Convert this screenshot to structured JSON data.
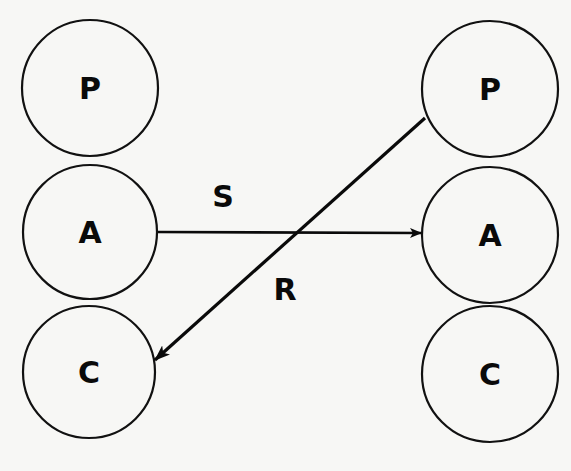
{
  "diagram": {
    "left_column": {
      "nodes": [
        {
          "id": "left-P",
          "label": "P",
          "cx": 90,
          "cy": 88,
          "r": 68
        },
        {
          "id": "left-A",
          "label": "A",
          "cx": 90,
          "cy": 232,
          "r": 67
        },
        {
          "id": "left-C",
          "label": "C",
          "cx": 89,
          "cy": 372,
          "r": 66
        }
      ]
    },
    "right_column": {
      "nodes": [
        {
          "id": "right-P",
          "label": "P",
          "cx": 490,
          "cy": 89,
          "r": 68
        },
        {
          "id": "right-A",
          "label": "A",
          "cx": 490,
          "cy": 235,
          "r": 68
        },
        {
          "id": "right-C",
          "label": "C",
          "cx": 490,
          "cy": 374,
          "r": 68
        }
      ]
    },
    "edges": [
      {
        "id": "S",
        "label": "S",
        "from": "left-A",
        "to": "right-A",
        "x1": 158,
        "y1": 232,
        "x2": 421,
        "y2": 233,
        "label_x": 223,
        "label_y": 196
      },
      {
        "id": "R",
        "label": "R",
        "from": "right-P",
        "to": "left-C",
        "x1": 425,
        "y1": 118,
        "x2": 155,
        "y2": 360,
        "label_x": 285,
        "label_y": 289
      }
    ],
    "colors": {
      "stroke": "#0a0a0a",
      "background": "#f7f7f5"
    }
  }
}
